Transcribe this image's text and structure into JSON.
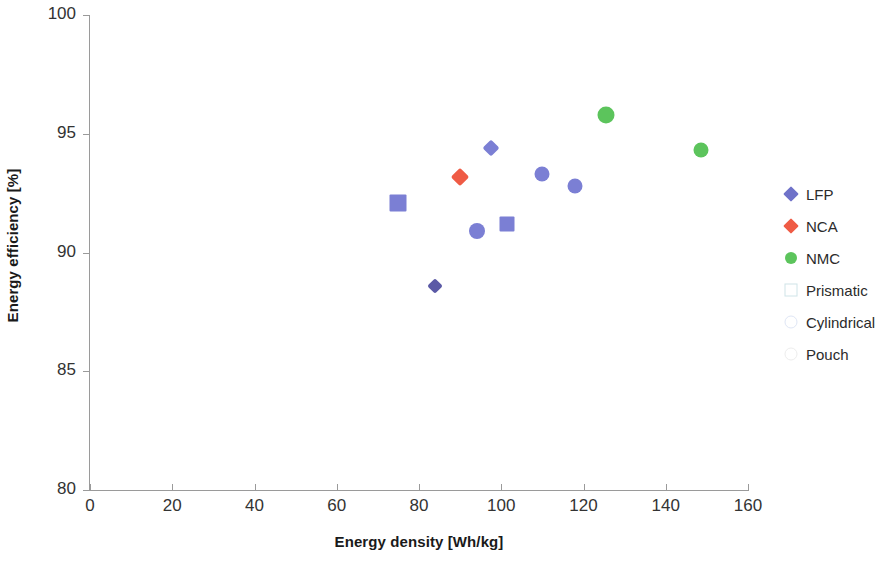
{
  "chart_data": {
    "type": "scatter",
    "title": "",
    "xlabel": "Energy density [Wh/kg]",
    "ylabel": "Energy efficiency [%]",
    "xlim": [
      0,
      160
    ],
    "ylim": [
      80,
      100
    ],
    "xticks": [
      "0",
      "20",
      "40",
      "60",
      "80",
      "100",
      "120",
      "140",
      "160"
    ],
    "yticks": [
      "80",
      "85",
      "90",
      "95",
      "100"
    ],
    "xtick_values": [
      0,
      20,
      40,
      60,
      80,
      100,
      120,
      140,
      160
    ],
    "ytick_values": [
      80,
      85,
      90,
      95,
      100
    ],
    "grid": false,
    "legend_position": "right",
    "series": [
      {
        "name": "LFP",
        "color": "#7b7fd4",
        "marker": "mixed",
        "points": [
          {
            "x": 75.0,
            "y": 92.1,
            "marker": "square",
            "color": "#7b7fd4",
            "size": 17
          },
          {
            "x": 84.0,
            "y": 88.6,
            "marker": "diamond",
            "color": "#5b5aa6",
            "size": 11
          },
          {
            "x": 94.0,
            "y": 90.9,
            "marker": "circle",
            "color": "#7b7fd4",
            "size": 16
          },
          {
            "x": 97.5,
            "y": 94.4,
            "marker": "diamond",
            "color": "#7b7fd4",
            "size": 12
          },
          {
            "x": 101.5,
            "y": 91.2,
            "marker": "square",
            "color": "#7b7fd4",
            "size": 15
          },
          {
            "x": 110.0,
            "y": 93.3,
            "marker": "circle",
            "color": "#7b7fd4",
            "size": 15
          },
          {
            "x": 118.0,
            "y": 92.8,
            "marker": "circle",
            "color": "#7b7fd4",
            "size": 15
          }
        ]
      },
      {
        "name": "NCA",
        "color": "#ef5b45",
        "marker": "diamond",
        "points": [
          {
            "x": 90.0,
            "y": 93.2,
            "marker": "diamond",
            "color": "#ef5b45",
            "size": 13
          }
        ]
      },
      {
        "name": "NMC",
        "color": "#5cc45c",
        "marker": "circle",
        "points": [
          {
            "x": 125.5,
            "y": 95.8,
            "marker": "circle",
            "color": "#5cc45c",
            "size": 17
          },
          {
            "x": 148.5,
            "y": 94.3,
            "marker": "circle",
            "color": "#5cc45c",
            "size": 15
          }
        ]
      }
    ],
    "legend": [
      {
        "label": "LFP",
        "marker": "diamond",
        "color": "#6f72c9",
        "style": "filled",
        "size": 11
      },
      {
        "label": "NCA",
        "marker": "diamond",
        "color": "#ef5b45",
        "style": "filled",
        "size": 11
      },
      {
        "label": "NMC",
        "marker": "circle",
        "color": "#5cc45c",
        "style": "filled",
        "size": 12
      },
      {
        "label": "Prismatic",
        "marker": "square",
        "color": "#cfe4e8",
        "style": "outline",
        "size": 11
      },
      {
        "label": "Cylindrical",
        "marker": "circle",
        "color": "#dfe6f5",
        "style": "outline",
        "size": 11
      },
      {
        "label": "Pouch",
        "marker": "circle",
        "color": "#ededed",
        "style": "outline",
        "size": 11
      }
    ]
  },
  "axes": {
    "x_title": "Energy density [Wh/kg]",
    "y_title": "Energy efficiency [%]"
  }
}
